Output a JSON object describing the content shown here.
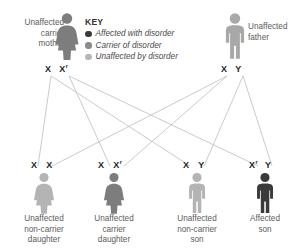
{
  "diagram": {
    "colors": {
      "affected": "#3a3a3a",
      "carrier": "#7d7d7d",
      "unaffected": "#b0b0b0",
      "line": "#b8b8b8",
      "text": "#5b5b5b",
      "genotype_text": "#1d1d1d"
    }
  },
  "key": {
    "title": "KEY",
    "items": [
      {
        "label": "Affected with disorder",
        "color": "#3a3a3a",
        "dot_name": "affected-dot"
      },
      {
        "label": "Carrier of disorder",
        "color": "#7d7d7d",
        "dot_name": "carrier-dot"
      },
      {
        "label": "Unaffected by disorder",
        "color": "#b0b0b0",
        "dot_name": "unaffected-dot"
      }
    ]
  },
  "parents": {
    "mother": {
      "label": "Unaffected\ncarrier\nmother",
      "sex": "female",
      "status": "carrier",
      "color": "#7d7d7d",
      "genotype": {
        "allele1": "X",
        "allele2": "X",
        "allele2_sup": "r"
      }
    },
    "father": {
      "label": "Unaffected\nfather",
      "sex": "male",
      "status": "unaffected",
      "color": "#a8a8a8",
      "genotype": {
        "allele1": "X",
        "allele2": "Y",
        "allele2_sup": ""
      }
    }
  },
  "children": [
    {
      "label": "Unaffected\nnon-carrier\ndaughter",
      "sex": "female",
      "status": "unaffected",
      "color": "#b4b4b4",
      "genotype": {
        "allele1": "X",
        "allele1_sup": "",
        "allele2": "X",
        "allele2_sup": ""
      }
    },
    {
      "label": "Unaffected\ncarrier\ndaughter",
      "sex": "female",
      "status": "carrier",
      "color": "#7d7d7d",
      "genotype": {
        "allele1": "X",
        "allele1_sup": "",
        "allele2": "X",
        "allele2_sup": "r"
      }
    },
    {
      "label": "Unaffected\nnon-carrier\nson",
      "sex": "male",
      "status": "unaffected",
      "color": "#b4b4b4",
      "genotype": {
        "allele1": "X",
        "allele1_sup": "",
        "allele2": "Y",
        "allele2_sup": ""
      }
    },
    {
      "label": "Affected\nson",
      "sex": "male",
      "status": "affected",
      "color": "#3a3a3a",
      "genotype": {
        "allele1": "X",
        "allele1_sup": "r",
        "allele2": "Y",
        "allele2_sup": ""
      }
    }
  ]
}
